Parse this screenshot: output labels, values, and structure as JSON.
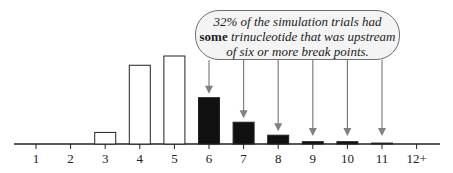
{
  "chart_data": {
    "type": "bar",
    "title": "",
    "xlabel": "",
    "ylabel": "",
    "categories": [
      "1",
      "2",
      "3",
      "4",
      "5",
      "6",
      "7",
      "8",
      "9",
      "10",
      "11",
      "12+"
    ],
    "values": [
      0,
      0,
      2.5,
      17,
      19,
      10,
      4.7,
      1.9,
      0.5,
      0.5,
      0.2,
      0
    ],
    "bar_styles": [
      "empty",
      "empty",
      "outline",
      "outline",
      "outline",
      "filled",
      "filled",
      "filled",
      "filled",
      "filled",
      "filled",
      "filled"
    ],
    "annotation": {
      "line1": "32% of the simulation trials had",
      "line2_bold": "some",
      "line2_rest": " trinucleotide that was upstream",
      "line3": "of six or more break points.",
      "points_to": [
        "6",
        "7",
        "8",
        "9",
        "10",
        "11"
      ]
    },
    "grid": false,
    "legend": null,
    "colors": {
      "outline": "#222222",
      "filled": "#111111",
      "arrow": "#808080",
      "callout_bg": "#f4f4f4"
    }
  }
}
